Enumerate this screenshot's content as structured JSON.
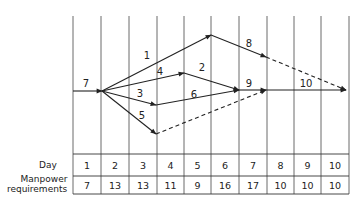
{
  "grid": {
    "x": [
      73,
      101,
      129,
      157,
      184,
      211,
      239,
      267,
      294,
      321,
      349
    ],
    "top": 16,
    "bottom": 194
  },
  "activities": [
    {
      "label": "7",
      "from": [
        73,
        91
      ],
      "to": [
        102,
        91
      ],
      "style": "solid",
      "label_pos": [
        86,
        87
      ]
    },
    {
      "label": "1",
      "from": [
        102,
        91
      ],
      "to": [
        211,
        35
      ],
      "style": "solid",
      "label_pos": [
        147,
        59
      ]
    },
    {
      "label": "4",
      "from": [
        102,
        91
      ],
      "to": [
        184,
        73
      ],
      "style": "solid",
      "label_pos": [
        160,
        75
      ]
    },
    {
      "label": "3",
      "from": [
        102,
        91
      ],
      "to": [
        156,
        105
      ],
      "style": "solid",
      "label_pos": [
        140,
        97
      ]
    },
    {
      "label": "5",
      "from": [
        102,
        91
      ],
      "to": [
        156,
        134
      ],
      "style": "solid",
      "label_pos": [
        142,
        119
      ]
    },
    {
      "label": "2",
      "from": [
        184,
        73
      ],
      "to": [
        239,
        90
      ],
      "style": "solid",
      "label_pos": [
        202,
        71
      ]
    },
    {
      "label": "6",
      "from": [
        156,
        105
      ],
      "to": [
        239,
        90
      ],
      "style": "solid",
      "label_pos": [
        194,
        98
      ]
    },
    {
      "label": "",
      "from": [
        156,
        134
      ],
      "to": [
        266,
        90
      ],
      "style": "dashed",
      "label_pos": null
    },
    {
      "label": "8",
      "from": [
        211,
        35
      ],
      "to": [
        266,
        57
      ],
      "style": "solid",
      "label_pos": [
        249,
        47
      ]
    },
    {
      "label": "",
      "from": [
        266,
        57
      ],
      "to": [
        346,
        90
      ],
      "style": "dashed",
      "label_pos": null
    },
    {
      "label": "9",
      "from": [
        239,
        90
      ],
      "to": [
        266,
        90
      ],
      "style": "solid",
      "label_pos": [
        249,
        87
      ]
    },
    {
      "label": "10",
      "from": [
        266,
        90
      ],
      "to": [
        346,
        90
      ],
      "style": "solid",
      "label_pos": [
        306,
        87
      ]
    }
  ],
  "table": {
    "row_labels": {
      "day": "Day",
      "manpower_line1": "Manpower",
      "manpower_line2": "requirements"
    },
    "days": [
      "1",
      "2",
      "3",
      "4",
      "5",
      "6",
      "7",
      "8",
      "9",
      "10"
    ],
    "manpower": [
      "7",
      "13",
      "13",
      "11",
      "9",
      "16",
      "17",
      "10",
      "10",
      "10"
    ]
  }
}
